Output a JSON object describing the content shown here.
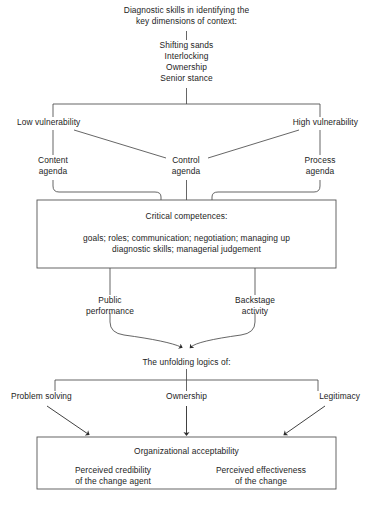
{
  "figure": {
    "title_lines": [
      "Diagnostic skills in identifying the",
      "key dimensions of context:"
    ],
    "dimensions": [
      "Shifting sands",
      "Interlocking",
      "Ownership",
      "Senior stance"
    ],
    "vulnerability": {
      "low": "Low vulnerability",
      "high": "High vulnerability"
    },
    "agendas": {
      "content": [
        "Content",
        "agenda"
      ],
      "control": [
        "Control",
        "agenda"
      ],
      "process": [
        "Process",
        "agenda"
      ]
    },
    "competences_box": {
      "heading": "Critical competences:",
      "body_lines": [
        "goals; roles; communication; negotiation; managing up",
        "diagnostic skills; managerial judgement"
      ]
    },
    "modes": {
      "public": [
        "Public",
        "performance"
      ],
      "backstage": [
        "Backstage",
        "activity"
      ]
    },
    "logics_heading": "The unfolding logics of:",
    "logics": {
      "problem_solving": "Problem solving",
      "ownership": "Ownership",
      "legitimacy": "Legitimacy"
    },
    "acceptability_box": {
      "heading": "Organizational acceptability",
      "left_lines": [
        "Perceived credibility",
        "of the change agent"
      ],
      "right_lines": [
        "Perceived effectiveness",
        "of the change"
      ]
    },
    "caption": {
      "label": "Figure 1.3",
      "text": "The争 — partially cropped caption"
    },
    "colors": {
      "line": "#4a4a4a",
      "box_border": "#555555",
      "text": "#1c1c1c",
      "background": "#ffffff"
    }
  }
}
